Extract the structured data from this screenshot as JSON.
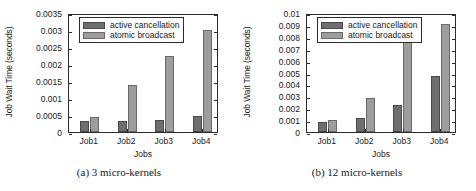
{
  "figure": {
    "panels": [
      {
        "caption": "(a)  3 micro-kernels",
        "chart_data": {
          "type": "bar",
          "title": "",
          "xlabel": "Jobs",
          "ylabel": "Job Wait Time (seconds)",
          "categories": [
            "Job1",
            "Job2",
            "Job3",
            "Job4"
          ],
          "series": [
            {
              "name": "active cancellation",
              "values": [
                0.00033,
                0.00032,
                0.00035,
                0.00048
              ],
              "color": "#6e6e6e"
            },
            {
              "name": "atomic broadcast",
              "values": [
                0.00044,
                0.00138,
                0.00225,
                0.00301
              ],
              "color": "#9d9d9d"
            }
          ],
          "ylim": [
            0,
            0.0035
          ],
          "yticks": [
            "0",
            "0.0005",
            "0.001",
            "0.0015",
            "0.002",
            "0.0025",
            "0.003",
            "0.0035"
          ],
          "ytick_values": [
            0,
            0.0005,
            0.001,
            0.0015,
            0.002,
            0.0025,
            0.003,
            0.0035
          ],
          "grid": false,
          "legend_position": "top-left-inside"
        }
      },
      {
        "caption": "(b)  12 micro-kernels",
        "chart_data": {
          "type": "bar",
          "title": "",
          "xlabel": "Jobs",
          "ylabel": "Job Wait Time (seconds)",
          "categories": [
            "Job1",
            "Job2",
            "Job3",
            "Job4"
          ],
          "series": [
            {
              "name": "active cancellation",
              "values": [
                0.0008,
                0.0012,
                0.0023,
                0.0047
              ],
              "color": "#6e6e6e"
            },
            {
              "name": "atomic broadcast",
              "values": [
                0.001,
                0.0029,
                0.0088,
                0.0091
              ],
              "color": "#9d9d9d"
            }
          ],
          "ylim": [
            0,
            0.01
          ],
          "yticks": [
            "0",
            "0.001",
            "0.002",
            "0.003",
            "0.004",
            "0.005",
            "0.006",
            "0.007",
            "0.008",
            "0.009",
            "0.01"
          ],
          "ytick_values": [
            0,
            0.001,
            0.002,
            0.003,
            0.004,
            0.005,
            0.006,
            0.007,
            0.008,
            0.009,
            0.01
          ],
          "grid": false,
          "legend_position": "top-left-inside"
        }
      }
    ]
  }
}
